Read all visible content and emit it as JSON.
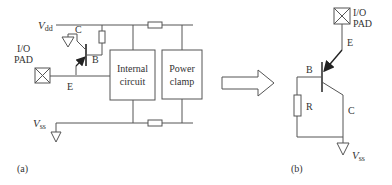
{
  "panel_a": {
    "label": "(a)",
    "vdd_label": "V",
    "vdd_sub": "dd",
    "vss_label": "V",
    "vss_sub": "ss",
    "pad_label_line1": "I/O",
    "pad_label_line2": "PAD",
    "collector_label": "C",
    "base_label": "B",
    "emitter_label": "E",
    "internal_circuit_line1": "Internal",
    "internal_circuit_line2": "circuit",
    "power_clamp_line1": "Power",
    "power_clamp_line2": "clamp"
  },
  "panel_b": {
    "label": "(b)",
    "pad_label_line1": "I/O",
    "pad_label_line2": "PAD",
    "emitter_label": "E",
    "base_label": "B",
    "resistor_label": "R",
    "collector_label": "C",
    "vss_label": "V",
    "vss_sub": "ss"
  },
  "colors": {
    "line": "#555555",
    "text": "#333333",
    "background": "#ffffff"
  }
}
